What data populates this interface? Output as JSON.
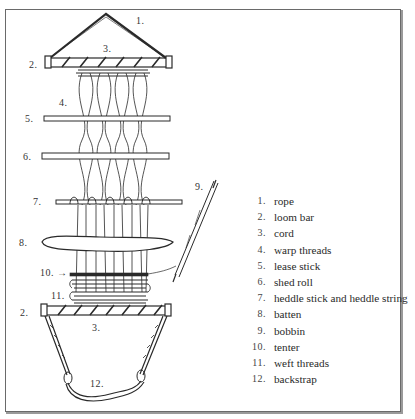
{
  "diagram": {
    "callouts": [
      {
        "id": "1",
        "text": "1.",
        "x": 136,
        "y": 15
      },
      {
        "id": "3a",
        "text": "3.",
        "x": 103,
        "y": 43
      },
      {
        "id": "2a",
        "text": "2.",
        "x": 29,
        "y": 59
      },
      {
        "id": "4",
        "text": "4.",
        "x": 59,
        "y": 97
      },
      {
        "id": "5",
        "text": "5.",
        "x": 25,
        "y": 113
      },
      {
        "id": "6",
        "text": "6.",
        "x": 23,
        "y": 151
      },
      {
        "id": "7",
        "text": "7.",
        "x": 33,
        "y": 198
      },
      {
        "id": "8",
        "text": "8.",
        "x": 19,
        "y": 238
      },
      {
        "id": "9",
        "text": "9.",
        "x": 195,
        "y": 182
      },
      {
        "id": "10",
        "text": "10. →",
        "x": 40,
        "y": 267
      },
      {
        "id": "11",
        "text": "11.",
        "x": 51,
        "y": 290
      },
      {
        "id": "2b",
        "text": "2.",
        "x": 20,
        "y": 307
      },
      {
        "id": "3b",
        "text": "3.",
        "x": 92,
        "y": 322
      },
      {
        "id": "12",
        "text": "12.",
        "x": 90,
        "y": 378
      }
    ]
  },
  "legend": {
    "items": [
      {
        "num": "1.",
        "label": "rope"
      },
      {
        "num": "2.",
        "label": "loom bar"
      },
      {
        "num": "3.",
        "label": "cord"
      },
      {
        "num": "4.",
        "label": "warp threads"
      },
      {
        "num": "5.",
        "label": "lease stick"
      },
      {
        "num": "6.",
        "label": "shed roll"
      },
      {
        "num": "7.",
        "label": "heddle stick and heddle string"
      },
      {
        "num": "8.",
        "label": "batten"
      },
      {
        "num": "9.",
        "label": "bobbin"
      },
      {
        "num": "10.",
        "label": "tenter"
      },
      {
        "num": "11.",
        "label": "weft threads"
      },
      {
        "num": "12.",
        "label": "backstrap"
      }
    ]
  },
  "colors": {
    "ink": "#2a2a2a",
    "frame": "#6a6a6a",
    "background": "#ffffff"
  }
}
